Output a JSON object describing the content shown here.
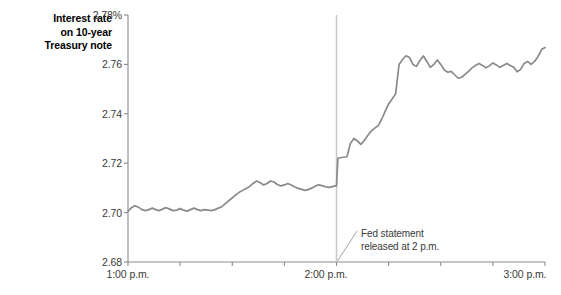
{
  "chart_data": {
    "type": "line",
    "title": "Interest rate on 10-year Treasury note",
    "title_lines": [
      "Interest rate",
      "on 10-year",
      "Treasury note"
    ],
    "xlabel": "",
    "ylabel": "Interest rate on 10-year Treasury note",
    "ylim": [
      2.68,
      2.78
    ],
    "xlim": [
      0,
      120
    ],
    "grid": false,
    "legend": false,
    "line_color": "#8a8a8a",
    "axis_color": "#8c8c8c",
    "event_line_color": "#c9c9c9",
    "ytick_labels": [
      "2.78%",
      "2.76",
      "2.74",
      "2.72",
      "2.70",
      "2.68"
    ],
    "ytick_values": [
      2.78,
      2.76,
      2.74,
      2.72,
      2.7,
      2.68
    ],
    "xtick_labels": [
      "1:00 p.m.",
      "",
      "",
      "",
      "2:00 p.m.",
      "",
      "",
      "",
      "3:00 p.m."
    ],
    "xtick_values": [
      0,
      15,
      30,
      45,
      60,
      75,
      90,
      105,
      120
    ],
    "annotations": [
      {
        "text": "Fed statement\nreleased at 2 p.m.",
        "x": 60,
        "y": 2.68,
        "note": "leader line points to 2:00 p.m. event marker"
      }
    ],
    "event_marker": {
      "x": 60,
      "label": "2:00 p.m. Fed statement"
    },
    "x_unit": "minutes after 1:00 p.m.",
    "x": [
      0,
      1,
      2,
      3,
      4,
      5,
      6,
      7,
      8,
      9,
      10,
      11,
      12,
      13,
      14,
      15,
      16,
      17,
      18,
      19,
      20,
      21,
      22,
      23,
      24,
      25,
      26,
      27,
      28,
      29,
      30,
      31,
      32,
      33,
      34,
      35,
      36,
      37,
      38,
      39,
      40,
      41,
      42,
      43,
      44,
      45,
      46,
      47,
      48,
      49,
      50,
      51,
      52,
      53,
      54,
      55,
      56,
      57,
      58,
      59,
      59.6,
      60,
      60.4,
      61,
      62,
      63,
      64,
      65,
      66,
      67,
      68,
      69,
      70,
      71,
      72,
      73,
      74,
      75,
      76,
      77,
      78,
      79,
      80,
      81,
      82,
      83,
      84,
      85,
      86,
      87,
      88,
      89,
      90,
      91,
      92,
      93,
      94,
      95,
      96,
      97,
      98,
      99,
      100,
      101,
      102,
      103,
      104,
      105,
      106,
      107,
      108,
      109,
      110,
      111,
      112,
      113,
      114,
      115,
      116,
      117,
      118,
      119,
      120
    ],
    "y": [
      2.7005,
      2.702,
      2.7028,
      2.7022,
      2.7012,
      2.7008,
      2.7012,
      2.7018,
      2.7012,
      2.7008,
      2.7015,
      2.702,
      2.7014,
      2.7008,
      2.701,
      2.7016,
      2.701,
      2.7006,
      2.7012,
      2.7018,
      2.7012,
      2.7008,
      2.7012,
      2.701,
      2.7008,
      2.7012,
      2.7018,
      2.7024,
      2.7036,
      2.7048,
      2.706,
      2.7072,
      2.7082,
      2.709,
      2.7098,
      2.7106,
      2.7118,
      2.7128,
      2.7122,
      2.7112,
      2.7118,
      2.7128,
      2.7124,
      2.7114,
      2.7108,
      2.7112,
      2.7118,
      2.7112,
      2.7104,
      2.7098,
      2.7094,
      2.709,
      2.7094,
      2.71,
      2.7108,
      2.7112,
      2.7108,
      2.7104,
      2.7102,
      2.7106,
      2.7108,
      2.7108,
      2.722,
      2.7222,
      2.7224,
      2.7226,
      2.728,
      2.73,
      2.729,
      2.7276,
      2.7292,
      2.7312,
      2.733,
      2.7342,
      2.7352,
      2.7378,
      2.741,
      2.744,
      2.746,
      2.748,
      2.76,
      2.762,
      2.7635,
      2.7628,
      2.76,
      2.7592,
      2.7616,
      2.7634,
      2.7612,
      2.7588,
      2.76,
      2.7618,
      2.76,
      2.7578,
      2.7568,
      2.7572,
      2.7558,
      2.7544,
      2.7548,
      2.756,
      2.7572,
      2.7586,
      2.7596,
      2.7604,
      2.7596,
      2.7586,
      2.7594,
      2.7606,
      2.7598,
      2.7588,
      2.7596,
      2.7604,
      2.7596,
      2.7588,
      2.757,
      2.758,
      2.7604,
      2.7612,
      2.76,
      2.7612,
      2.7632,
      2.766,
      2.7668
    ]
  },
  "chart": {
    "y_title_lines": [
      "Interest rate",
      "on 10-year",
      "Treasury note"
    ],
    "annotation_text": "Fed statement\nreleased at 2 p.m.",
    "ytick_0": "2.78%",
    "ytick_1": "2.76",
    "ytick_2": "2.74",
    "ytick_3": "2.72",
    "ytick_4": "2.70",
    "ytick_5": "2.68",
    "xtick_0": "1:00 p.m.",
    "xtick_1": "2:00 p.m.",
    "xtick_2": "3:00 p.m."
  }
}
